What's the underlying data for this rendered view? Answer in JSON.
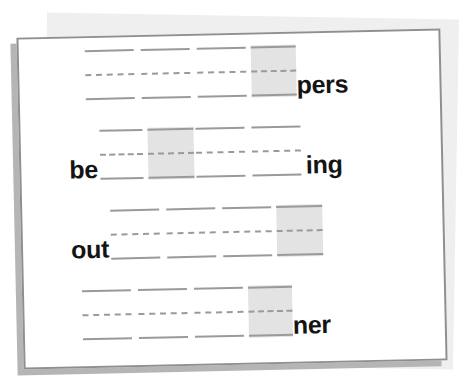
{
  "worksheet": {
    "kind": "handwriting-practice-worksheet",
    "paper_color": "#ffffff",
    "border_color": "#8f8f8f",
    "rule_color": "#9a9a9a",
    "answer_box_color": "#e3e3e3",
    "text_color": "#141414",
    "rows": [
      {
        "id": "row-1",
        "prefix": "",
        "suffix": "pers",
        "cells": [
          {
            "type": "lines",
            "width": 56
          },
          {
            "type": "lines",
            "width": 56
          },
          {
            "type": "lines",
            "width": 56
          },
          {
            "type": "box",
            "width": 45
          }
        ]
      },
      {
        "id": "row-2",
        "prefix": "be",
        "suffix": "ing",
        "cells": [
          {
            "type": "lines",
            "width": 50
          },
          {
            "type": "box",
            "width": 46
          },
          {
            "type": "lines",
            "width": 56
          },
          {
            "type": "lines",
            "width": 56
          }
        ]
      },
      {
        "id": "row-3",
        "prefix": "out",
        "suffix": "",
        "cells": [
          {
            "type": "lines",
            "width": 56
          },
          {
            "type": "lines",
            "width": 56
          },
          {
            "type": "lines",
            "width": 56
          },
          {
            "type": "box",
            "width": 46
          }
        ]
      },
      {
        "id": "row-4",
        "prefix": "",
        "suffix": "ner",
        "cells": [
          {
            "type": "lines",
            "width": 56
          },
          {
            "type": "lines",
            "width": 56
          },
          {
            "type": "lines",
            "width": 56
          },
          {
            "type": "box",
            "width": 44
          }
        ]
      }
    ]
  }
}
